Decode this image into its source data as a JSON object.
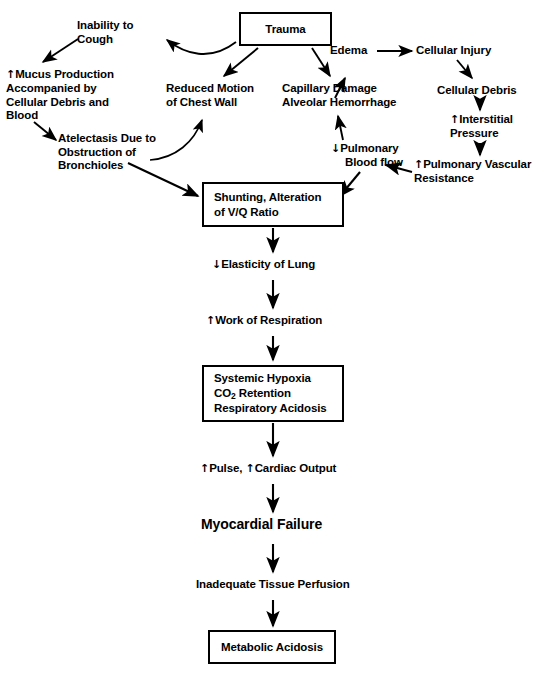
{
  "diagram": {
    "title_node": "Trauma",
    "type": "flowchart",
    "nodes": [
      {
        "id": "trauma",
        "label": "Trauma",
        "shape": "box",
        "x": 239,
        "y": 12,
        "w": 93,
        "h": 34
      },
      {
        "id": "inability",
        "label": "Inability to\nCough",
        "shape": "text",
        "x": 77,
        "y": 19,
        "w": 100,
        "h": 30
      },
      {
        "id": "mucus",
        "label": "↑ Mucus Production\nAccompanied by\nCellular Debris and\nBlood",
        "shape": "text",
        "x": 6,
        "y": 68,
        "w": 135,
        "h": 56
      },
      {
        "id": "atelectasis",
        "label": "Atelectasis Due to\nObstruction of\nBronchioles",
        "shape": "text",
        "x": 58,
        "y": 132,
        "w": 120,
        "h": 44
      },
      {
        "id": "reduced",
        "label": "Reduced Motion\nof Chest Wall",
        "shape": "text",
        "x": 166,
        "y": 82,
        "w": 110,
        "h": 30
      },
      {
        "id": "capillary",
        "label": "Capillary Damage\nAlveolar Hemorrhage",
        "shape": "text",
        "x": 282,
        "y": 82,
        "w": 128,
        "h": 30
      },
      {
        "id": "edema",
        "label": "Edema",
        "shape": "text",
        "x": 330,
        "y": 44,
        "w": 45,
        "h": 15
      },
      {
        "id": "cellinjury",
        "label": "Cellular Injury",
        "shape": "text",
        "x": 416,
        "y": 44,
        "w": 84,
        "h": 15
      },
      {
        "id": "celldebris",
        "label": "Cellular Debris",
        "shape": "text",
        "x": 437,
        "y": 84,
        "w": 86,
        "h": 15
      },
      {
        "id": "interstitial",
        "label": "↑ Interstitial\nPressure",
        "shape": "text",
        "x": 455,
        "y": 113,
        "w": 78,
        "h": 30
      },
      {
        "id": "pvr",
        "label": "↑ Pulmonary Vascular\nResistance",
        "shape": "text",
        "x": 414,
        "y": 158,
        "w": 124,
        "h": 30
      },
      {
        "id": "pulmblood",
        "label": "↓ Pulmonary\nBlood flow",
        "shape": "text",
        "x": 331,
        "y": 142,
        "w": 82,
        "h": 30
      },
      {
        "id": "shunting",
        "label": "Shunting, Alteration\nof V/Q Ratio",
        "shape": "box",
        "x": 202,
        "y": 182,
        "w": 142,
        "h": 45
      },
      {
        "id": "elasticity",
        "label": "↓ Elasticity of Lung",
        "shape": "text",
        "x": 218,
        "y": 258,
        "w": 115,
        "h": 15
      },
      {
        "id": "work",
        "label": "↑ Work of Respiration",
        "shape": "text",
        "x": 212,
        "y": 314,
        "w": 125,
        "h": 15
      },
      {
        "id": "hypoxia",
        "label": "Systemic Hypoxia\nCO2 Retention\nRespiratory Acidosis",
        "shape": "box",
        "x": 202,
        "y": 365,
        "w": 142,
        "h": 57
      },
      {
        "id": "pulse",
        "label": "↑ Pulse, ↑ Cardiac Output",
        "shape": "text",
        "x": 204,
        "y": 462,
        "w": 140,
        "h": 15
      },
      {
        "id": "myocardial",
        "label": "Myocardial Failure",
        "shape": "text",
        "x": 206,
        "y": 518,
        "w": 135,
        "h": 18
      },
      {
        "id": "perfusion",
        "label": "Inadequate Tissue Perfusion",
        "shape": "text",
        "x": 203,
        "y": 578,
        "w": 148,
        "h": 15
      },
      {
        "id": "metabolic",
        "label": "Metabolic Acidosis",
        "shape": "box",
        "x": 208,
        "y": 630,
        "w": 128,
        "h": 34
      }
    ],
    "edges": [
      {
        "from": "trauma",
        "to": "inability",
        "style": "curved"
      },
      {
        "from": "trauma",
        "to": "reduced",
        "style": "straight"
      },
      {
        "from": "trauma",
        "to": "capillary",
        "style": "straight"
      },
      {
        "from": "inability",
        "to": "mucus",
        "style": "straight"
      },
      {
        "from": "mucus",
        "to": "atelectasis",
        "style": "straight"
      },
      {
        "from": "atelectasis",
        "to": "reduced",
        "style": "curved"
      },
      {
        "from": "atelectasis",
        "to": "shunting",
        "style": "straight"
      },
      {
        "from": "reduced",
        "to": "capillary",
        "style": "straight"
      },
      {
        "from": "edema",
        "to": "cellinjury",
        "style": "straight"
      },
      {
        "from": "cellinjury",
        "to": "celldebris",
        "style": "straight"
      },
      {
        "from": "celldebris",
        "to": "interstitial",
        "style": "straight"
      },
      {
        "from": "interstitial",
        "to": "pvr",
        "style": "straight"
      },
      {
        "from": "pvr",
        "to": "pulmblood",
        "style": "straight"
      },
      {
        "from": "pulmblood",
        "to": "capillary",
        "style": "straight"
      },
      {
        "from": "pulmblood",
        "to": "shunting",
        "style": "straight"
      },
      {
        "from": "pvr",
        "to": "shunting",
        "style": "straight"
      },
      {
        "from": "shunting",
        "to": "elasticity",
        "style": "straight"
      },
      {
        "from": "elasticity",
        "to": "work",
        "style": "straight"
      },
      {
        "from": "work",
        "to": "hypoxia",
        "style": "straight"
      },
      {
        "from": "hypoxia",
        "to": "pulse",
        "style": "straight"
      },
      {
        "from": "pulse",
        "to": "myocardial",
        "style": "straight"
      },
      {
        "from": "myocardial",
        "to": "perfusion",
        "style": "straight"
      },
      {
        "from": "perfusion",
        "to": "metabolic",
        "style": "straight"
      }
    ]
  },
  "labels": {
    "trauma": "Trauma",
    "inability_l1": "Inability to",
    "inability_l2": "Cough",
    "mucus_l1": "Mucus Production",
    "mucus_l2": "Accompanied by",
    "mucus_l3": "Cellular Debris and",
    "mucus_l4": "Blood",
    "mucus_arrow": "↑",
    "atelectasis_l1": "Atelectasis Due to",
    "atelectasis_l2": "Obstruction of",
    "atelectasis_l3": "Bronchioles",
    "reduced_l1": "Reduced Motion",
    "reduced_l2": "of Chest Wall",
    "capillary_l1": "Capillary Damage",
    "capillary_l2": "Alveolar Hemorrhage",
    "edema": "Edema",
    "cellular_injury": "Cellular Injury",
    "cellular_debris": "Cellular Debris",
    "interstitial_arrow": "↑",
    "interstitial_l1": "Interstitial",
    "interstitial_l2": "Pressure",
    "pvr_arrow": "↑",
    "pvr_l1": "Pulmonary Vascular",
    "pvr_l2": "Resistance",
    "pulmblood_arrow": "↓",
    "pulmblood_l1": "Pulmonary",
    "pulmblood_l2": "Blood flow",
    "shunting_l1": "Shunting, Alteration",
    "shunting_l2": "of V/Q Ratio",
    "elasticity_arrow": "↓",
    "elasticity_text": "Elasticity of Lung",
    "work_arrow": "↑",
    "work_text": "Work of Respiration",
    "hypoxia_l1": "Systemic Hypoxia",
    "hypoxia_l2_pre": "CO",
    "hypoxia_l2_sub": "2",
    "hypoxia_l2_post": " Retention",
    "hypoxia_l3": "Respiratory Acidosis",
    "pulse_arrow1": "↑",
    "pulse_text1": "Pulse,",
    "pulse_arrow2": "↑",
    "pulse_text2": "Cardiac Output",
    "myocardial": "Myocardial Failure",
    "perfusion": "Inadequate Tissue Perfusion",
    "metabolic": "Metabolic Acidosis"
  },
  "colors": {
    "stroke": "#000000",
    "background": "#ffffff",
    "text": "#000000"
  }
}
